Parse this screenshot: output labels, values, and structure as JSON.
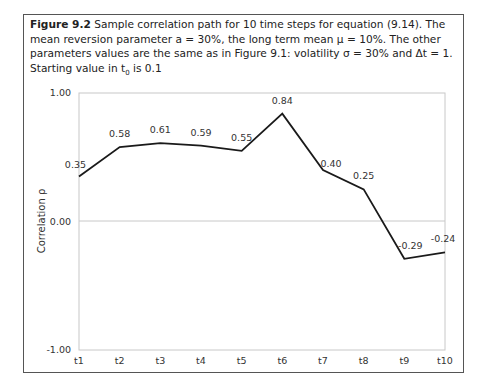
{
  "caption": {
    "label": "Figure 9.2",
    "text": "Sample correlation path for 10 time steps for equation (9.14). The mean reversion parameter a = 30%, the long term mean μ = 10%. The other parameters values are the same as in Figure 9.1: volatility σ = 30% and Δt = 1. Starting value in t",
    "subscript": "0",
    "tail": " is 0.1"
  },
  "chart_data": {
    "type": "line",
    "title": "Sample correlation path for 10 time steps for equation (9.14)",
    "xlabel": "",
    "ylabel": "Correlation ρ",
    "categories": [
      "t1",
      "t2",
      "t3",
      "t4",
      "t5",
      "t6",
      "t7",
      "t8",
      "t9",
      "t10"
    ],
    "series": [
      {
        "name": "Correlation path",
        "values": [
          0.35,
          0.58,
          0.61,
          0.59,
          0.55,
          0.84,
          0.4,
          0.25,
          -0.29,
          -0.24
        ]
      }
    ],
    "data_labels": [
      "0.35",
      "0.58",
      "0.61",
      "0.59",
      "0.55",
      "0.84",
      "0.40",
      "0.25",
      "-0.29",
      "-0.24"
    ],
    "yticks": [
      "1.00",
      "0.00",
      "-1.00"
    ],
    "ylim": [
      -1.0,
      1.0
    ],
    "grid": "horizontal at 0.00",
    "legend": "none",
    "line_color": "#1a1a1a"
  }
}
